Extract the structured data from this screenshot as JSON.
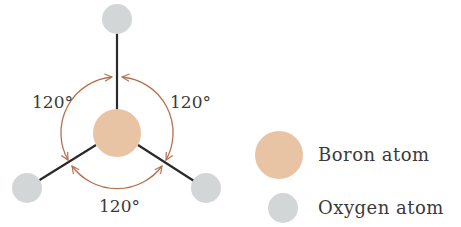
{
  "diagram": {
    "colors": {
      "boron": "#e8c3a4",
      "oxygen": "#d3d6d6",
      "bond": "#2a2a2a",
      "arc": "#b5704f",
      "text": "#3a3a3a"
    },
    "angles": [
      {
        "label": "120°",
        "position": "upper-left"
      },
      {
        "label": "120°",
        "position": "upper-right"
      },
      {
        "label": "120°",
        "position": "bottom"
      }
    ],
    "atoms": {
      "center": {
        "type": "boron"
      },
      "outer": [
        {
          "type": "oxygen",
          "position": "top"
        },
        {
          "type": "oxygen",
          "position": "bottom-left"
        },
        {
          "type": "oxygen",
          "position": "bottom-right"
        }
      ]
    }
  },
  "legend": {
    "items": [
      {
        "label": "Boron atom",
        "swatch": "boron"
      },
      {
        "label": "Oxygen atom",
        "swatch": "oxygen"
      }
    ]
  }
}
